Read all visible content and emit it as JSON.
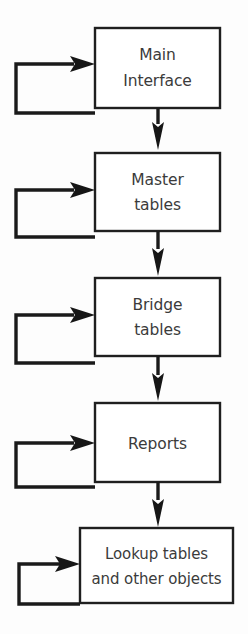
{
  "diagram": {
    "type": "flowchart",
    "orientation": "top-to-bottom",
    "background_color": "#fdfdfd",
    "line_color": "#1a1a1a",
    "text_color": "#3b3b3b",
    "box_fill": "#ffffff",
    "nodes": [
      {
        "id": "main-interface",
        "lines": [
          "Main",
          "Interface"
        ],
        "line1": "Main",
        "line2": "Interface",
        "order": 1
      },
      {
        "id": "master-tables",
        "lines": [
          "Master",
          "tables"
        ],
        "line1": "Master",
        "line2": "tables",
        "order": 2
      },
      {
        "id": "bridge-tables",
        "lines": [
          "Bridge",
          "tables"
        ],
        "line1": "Bridge",
        "line2": "tables",
        "order": 3
      },
      {
        "id": "reports",
        "lines": [
          "Reports"
        ],
        "line1": "Reports",
        "line2": "",
        "order": 4
      },
      {
        "id": "lookup-tables-and-other-objects",
        "lines": [
          "Lookup tables",
          "and other objects"
        ],
        "line1": "Lookup tables",
        "line2": "and other objects",
        "order": 5
      }
    ],
    "connections": [
      {
        "from": "main-interface",
        "to": "master-tables",
        "kind": "down-arrow"
      },
      {
        "from": "master-tables",
        "to": "bridge-tables",
        "kind": "down-arrow"
      },
      {
        "from": "bridge-tables",
        "to": "reports",
        "kind": "down-arrow"
      },
      {
        "from": "reports",
        "to": "lookup-tables-and-other-objects",
        "kind": "down-arrow"
      },
      {
        "from": "main-interface",
        "to": "main-interface",
        "kind": "feedback-loop-left"
      },
      {
        "from": "master-tables",
        "to": "master-tables",
        "kind": "feedback-loop-left"
      },
      {
        "from": "bridge-tables",
        "to": "bridge-tables",
        "kind": "feedback-loop-left"
      },
      {
        "from": "reports",
        "to": "reports",
        "kind": "feedback-loop-left"
      },
      {
        "from": "lookup-tables-and-other-objects",
        "to": "lookup-tables-and-other-objects",
        "kind": "feedback-loop-left"
      }
    ]
  }
}
